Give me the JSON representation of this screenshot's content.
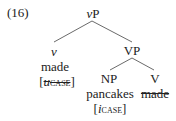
{
  "example_number": "(16)",
  "tree": {
    "root": {
      "label_italic": "v",
      "label_rest": "P"
    },
    "left": {
      "category": "v",
      "word": "made",
      "feature_open": "[",
      "feature_prefix": "u",
      "feature_name": "case",
      "feature_close": "]",
      "feature_struck": true
    },
    "right": {
      "label": "VP",
      "np": {
        "category": "NP",
        "word": "pancakes",
        "feature_open": "[",
        "feature_prefix": "i",
        "feature_name": "case",
        "feature_close": "]"
      },
      "v": {
        "category": "V",
        "word": "made",
        "word_struck": true
      }
    }
  }
}
